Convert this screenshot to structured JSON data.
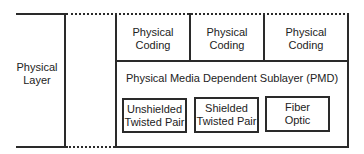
{
  "diagram": {
    "left_layer": {
      "line1": "Physical",
      "line2": "Layer"
    },
    "coding": [
      {
        "line1": "Physical",
        "line2": "Coding"
      },
      {
        "line1": "Physical",
        "line2": "Coding"
      },
      {
        "line1": "Physical",
        "line2": "Coding"
      }
    ],
    "pmd": {
      "title": "Physical Media Dependent Sublayer (PMD)"
    },
    "media": [
      {
        "line1": "Unshielded",
        "line2": "Twisted Pair"
      },
      {
        "line1": "Shielded",
        "line2": "Twisted Pair"
      },
      {
        "line1": "Fiber",
        "line2": "Optic"
      }
    ],
    "colors": {
      "line": "#2a2a2a",
      "background": "#ffffff"
    }
  }
}
